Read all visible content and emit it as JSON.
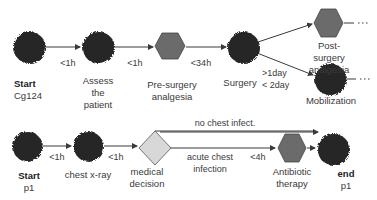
{
  "colors": {
    "circle_fill": "#262626",
    "hexagon_fill": "#6b6b6b",
    "diamond_fill": "#d8d8d8",
    "line": "#3a3a3a"
  },
  "pathway_cg124": {
    "nodes": [
      {
        "id": "start",
        "shape": "circle",
        "title": "Start",
        "subtitle": "Cg124"
      },
      {
        "id": "assess",
        "shape": "circle",
        "label": "Assess\nthe\npatient"
      },
      {
        "id": "pre_analgesia",
        "shape": "hexagon",
        "label": "Pre-surgery\nanalgesia"
      },
      {
        "id": "surgery",
        "shape": "circle",
        "label": "Surgery"
      },
      {
        "id": "post_analgesia",
        "shape": "hexagon",
        "label": "Post-surgery\nanalgesia"
      },
      {
        "id": "mobilization",
        "shape": "circle",
        "label": "Mobilization"
      }
    ],
    "edges": [
      {
        "from": "start",
        "to": "assess",
        "label": "<1h"
      },
      {
        "from": "assess",
        "to": "pre_analgesia",
        "label": "<1h"
      },
      {
        "from": "pre_analgesia",
        "to": "surgery",
        "label": "<34h"
      },
      {
        "from": "surgery",
        "to": "post_analgesia",
        "label": ""
      },
      {
        "from": "surgery",
        "to": "mobilization",
        "label": ">1day\n< 2day"
      }
    ],
    "continuation": "..."
  },
  "pathway_p1": {
    "nodes": [
      {
        "id": "start",
        "shape": "circle",
        "title": "Start",
        "subtitle": "p1"
      },
      {
        "id": "xray",
        "shape": "circle",
        "label": "chest x-ray"
      },
      {
        "id": "decision",
        "shape": "diamond",
        "label": "medical\ndecision"
      },
      {
        "id": "antibiotic",
        "shape": "hexagon",
        "label": "Antibiotic\ntherapy"
      },
      {
        "id": "end",
        "shape": "circle",
        "title": "end",
        "subtitle": "p1"
      }
    ],
    "edges": [
      {
        "from": "start",
        "to": "xray",
        "label": "<1h"
      },
      {
        "from": "xray",
        "to": "decision",
        "label": "<1h"
      },
      {
        "from": "decision",
        "to": "end",
        "label": "no chest infect."
      },
      {
        "from": "decision",
        "to": "antibiotic",
        "label": "acute chest\ninfection",
        "time": "<4h"
      },
      {
        "from": "antibiotic",
        "to": "end",
        "label": ""
      }
    ]
  }
}
